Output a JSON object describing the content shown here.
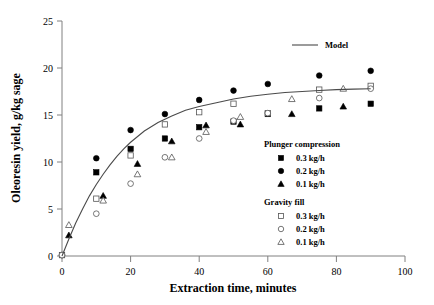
{
  "chart_data": {
    "type": "scatter",
    "title": "",
    "xlabel": "Extraction time, minutes",
    "ylabel": "Oleoresin yield, g/kg sage",
    "xlim": [
      0,
      100
    ],
    "ylim": [
      0,
      25
    ],
    "xticks": [
      0,
      20,
      40,
      60,
      80,
      100
    ],
    "yticks": [
      0,
      5,
      10,
      15,
      20,
      25
    ],
    "grid": false,
    "legend_position": "right-middle",
    "series": [
      {
        "name": "Plunger compression 0.3 kg/h",
        "group": "Plunger compression",
        "label": "0.3 kg/h",
        "marker": "filled-square",
        "points": [
          [
            0,
            0.1
          ],
          [
            10,
            8.9
          ],
          [
            20,
            11.4
          ],
          [
            30,
            12.5
          ],
          [
            40,
            13.7
          ],
          [
            50,
            14.3
          ],
          [
            60,
            15.1
          ],
          [
            75,
            15.7
          ],
          [
            90,
            16.2
          ]
        ]
      },
      {
        "name": "Plunger compression 0.2 kg/h",
        "group": "Plunger compression",
        "label": "0.2 kg/h",
        "marker": "filled-circle",
        "points": [
          [
            0,
            0.1
          ],
          [
            10,
            10.4
          ],
          [
            20,
            13.4
          ],
          [
            30,
            15.1
          ],
          [
            40,
            16.6
          ],
          [
            50,
            17.6
          ],
          [
            60,
            18.3
          ],
          [
            75,
            19.2
          ],
          [
            90,
            19.7
          ]
        ]
      },
      {
        "name": "Plunger compression 0.1 kg/h",
        "group": "Plunger compression",
        "label": "0.1 kg/h",
        "marker": "filled-triangle",
        "points": [
          [
            2,
            2.2
          ],
          [
            12,
            6.4
          ],
          [
            22,
            9.8
          ],
          [
            32,
            12.2
          ],
          [
            42,
            13.9
          ],
          [
            52,
            14.0
          ],
          [
            67,
            15.1
          ],
          [
            82,
            15.9
          ]
        ]
      },
      {
        "name": "Gravity fill 0.3 kg/h",
        "group": "Gravity fill",
        "label": "0.3 kg/h",
        "marker": "open-square",
        "points": [
          [
            0,
            0.1
          ],
          [
            10,
            6.1
          ],
          [
            20,
            10.7
          ],
          [
            30,
            14.0
          ],
          [
            40,
            15.3
          ],
          [
            50,
            16.2
          ],
          [
            60,
            15.2
          ],
          [
            75,
            17.7
          ],
          [
            90,
            18.1
          ]
        ]
      },
      {
        "name": "Gravity fill 0.2 kg/h",
        "group": "Gravity fill",
        "label": "0.2 kg/h",
        "marker": "open-circle",
        "points": [
          [
            0,
            0.1
          ],
          [
            10,
            4.5
          ],
          [
            20,
            7.7
          ],
          [
            30,
            10.5
          ],
          [
            40,
            12.5
          ],
          [
            50,
            14.4
          ],
          [
            60,
            15.2
          ],
          [
            75,
            16.8
          ],
          [
            90,
            17.8
          ]
        ]
      },
      {
        "name": "Gravity fill 0.1 kg/h",
        "group": "Gravity fill",
        "label": "0.1 kg/h",
        "marker": "open-triangle",
        "points": [
          [
            2,
            3.3
          ],
          [
            12,
            5.9
          ],
          [
            22,
            8.7
          ],
          [
            32,
            10.5
          ],
          [
            42,
            13.2
          ],
          [
            52,
            14.8
          ],
          [
            67,
            16.7
          ],
          [
            82,
            17.8
          ]
        ]
      },
      {
        "name": "Model",
        "label": "Model",
        "marker": "line",
        "points": [
          [
            0,
            0
          ],
          [
            2,
            1.8
          ],
          [
            4,
            3.5
          ],
          [
            6,
            5.0
          ],
          [
            8,
            6.4
          ],
          [
            10,
            7.6
          ],
          [
            12,
            8.7
          ],
          [
            14,
            9.7
          ],
          [
            16,
            10.6
          ],
          [
            18,
            11.4
          ],
          [
            20,
            12.1
          ],
          [
            24,
            13.3
          ],
          [
            28,
            14.2
          ],
          [
            32,
            14.9
          ],
          [
            36,
            15.5
          ],
          [
            40,
            15.9
          ],
          [
            45,
            16.3
          ],
          [
            50,
            16.7
          ],
          [
            55,
            17.0
          ],
          [
            60,
            17.2
          ],
          [
            65,
            17.4
          ],
          [
            70,
            17.5
          ],
          [
            75,
            17.6
          ],
          [
            80,
            17.7
          ],
          [
            85,
            17.75
          ],
          [
            90,
            17.8
          ]
        ]
      }
    ]
  },
  "legend": {
    "model_label": "Model",
    "groups": [
      {
        "heading": "Plunger compression",
        "entries": [
          {
            "marker": "filled-square",
            "label": "0.3 kg/h"
          },
          {
            "marker": "filled-circle",
            "label": "0.2 kg/h"
          },
          {
            "marker": "filled-triangle",
            "label": "0.1 kg/h"
          }
        ]
      },
      {
        "heading": "Gravity fill",
        "entries": [
          {
            "marker": "open-square",
            "label": "0.3 kg/h"
          },
          {
            "marker": "open-circle",
            "label": "0.2 kg/h"
          },
          {
            "marker": "open-triangle",
            "label": "0.1 kg/h"
          }
        ]
      }
    ]
  },
  "axes": {
    "x_title": "Extraction time, minutes",
    "y_title": "Oleoresin yield, g/kg sage",
    "x_tick_labels": [
      "0",
      "20",
      "40",
      "60",
      "80",
      "100"
    ],
    "y_tick_labels": [
      "0",
      "5",
      "10",
      "15",
      "20",
      "25"
    ]
  },
  "colors": {
    "axis": "#808080",
    "marker_filled": "#000000",
    "marker_open_stroke": "#555555",
    "model_line": "#4a4a4a",
    "background": "#ffffff"
  }
}
